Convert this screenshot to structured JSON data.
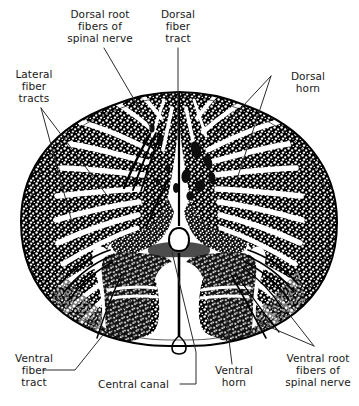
{
  "figure": {
    "type": "anatomical-illustration",
    "background_color": "#ffffff",
    "ink_color": "#000000",
    "text_color": "#191919"
  },
  "labels": [
    {
      "id": "dorsal-root",
      "text": "Dorsal root\nfibers of\nspinal nerve",
      "lines": [
        "Dorsal root",
        "fibers of",
        "spinal nerve"
      ],
      "align": "center",
      "position": "top-left"
    },
    {
      "id": "dorsal-fiber-tract",
      "text": "Dorsal\nfiber\ntract",
      "lines": [
        "Dorsal",
        "fiber",
        "tract"
      ],
      "align": "center",
      "position": "top-center"
    },
    {
      "id": "lateral-fiber-tracts",
      "text": "Lateral\nfiber\ntracts",
      "lines": [
        "Lateral",
        "fiber",
        "tracts"
      ],
      "align": "center",
      "position": "left-upper"
    },
    {
      "id": "dorsal-horn",
      "text": "Dorsal\nhorn",
      "lines": [
        "Dorsal",
        "horn"
      ],
      "align": "center",
      "position": "right-upper"
    },
    {
      "id": "ventral-fiber-tract",
      "text": "Ventral\nfiber\ntract",
      "lines": [
        "Ventral",
        "fiber",
        "tract"
      ],
      "align": "center",
      "position": "left-lower"
    },
    {
      "id": "central-canal",
      "text": "Central canal",
      "lines": [
        "Central canal"
      ],
      "align": "left",
      "position": "bottom-center-left"
    },
    {
      "id": "ventral-horn",
      "text": "Ventral\nhorn",
      "lines": [
        "Ventral",
        "horn"
      ],
      "align": "center",
      "position": "bottom-center"
    },
    {
      "id": "ventral-root",
      "text": "Ventral root\nfibers of\nspinal nerve",
      "lines": [
        "Ventral root",
        "fibers of",
        "spinal nerve"
      ],
      "align": "center",
      "position": "bottom-right"
    }
  ],
  "label_text": {
    "dorsal_root_l1": "Dorsal root",
    "dorsal_root_l2": "fibers of",
    "dorsal_root_l3": "spinal nerve",
    "dorsal_fiber_tract_l1": "Dorsal",
    "dorsal_fiber_tract_l2": "fiber",
    "dorsal_fiber_tract_l3": "tract",
    "lateral_fiber_l1": "Lateral",
    "lateral_fiber_l2": "fiber",
    "lateral_fiber_l3": "tracts",
    "dorsal_horn_l1": "Dorsal",
    "dorsal_horn_l2": "horn",
    "ventral_fiber_l1": "Ventral",
    "ventral_fiber_l2": "fiber",
    "ventral_fiber_l3": "tract",
    "central_canal": "Central canal",
    "ventral_horn_l1": "Ventral",
    "ventral_horn_l2": "horn",
    "ventral_root_l1": "Ventral root",
    "ventral_root_l2": "fibers of",
    "ventral_root_l3": "spinal nerve"
  },
  "structures": [
    {
      "name": "white matter",
      "description": "stippled outer region with radial striations"
    },
    {
      "name": "gray matter",
      "description": "butterfly / H-shaped central region"
    },
    {
      "name": "dorsal horn",
      "description": "posterior projection of gray matter"
    },
    {
      "name": "ventral horn",
      "description": "anterior, broader projection of gray matter"
    },
    {
      "name": "central canal",
      "description": "small oval opening at center of gray commissure"
    },
    {
      "name": "dorsal median sulcus",
      "description": "thin vertical cleft on the dorsal surface"
    },
    {
      "name": "ventral median fissure",
      "description": "deep notch on the ventral surface"
    },
    {
      "name": "dorsal root fibers",
      "description": "fiber bundles entering dorsolaterally"
    },
    {
      "name": "ventral root fibers",
      "description": "fiber bundles exiting ventrolaterally"
    }
  ]
}
